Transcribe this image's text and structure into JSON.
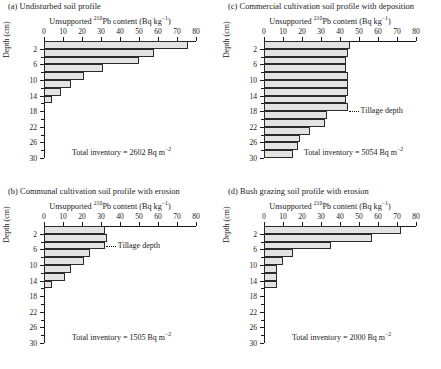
{
  "figure": {
    "axis_title_prefix": "Unsupported ",
    "axis_title_sup": "210",
    "axis_title_suffix": "Pb content (Bq kg",
    "axis_title_sup2": "−1",
    "axis_title_end": ")",
    "ylabel": "Depth (cm)",
    "inventory_prefix": "Total inventory = ",
    "inventory_unit": " Bq m",
    "inventory_unit_sup": "−2",
    "tillage_label": "Tillage depth",
    "xticks": [
      0,
      10,
      20,
      30,
      40,
      50,
      60,
      70,
      80
    ],
    "yticks_major": [
      2,
      6,
      10,
      14,
      18,
      22,
      26,
      30
    ],
    "yticks_minor": [
      0,
      4,
      8,
      12,
      16,
      20,
      24,
      28
    ],
    "bar_fill": "#e3e3e3",
    "bar_stroke": "#2b2b2b"
  },
  "chart_data": [
    {
      "id": "a",
      "type": "bar",
      "title": "(a) Undisturbed soil profile",
      "xlabel": "Unsupported 210Pb content (Bq kg-1)",
      "ylabel": "Depth (cm)",
      "xlim": [
        0,
        80
      ],
      "ylim": [
        0,
        30
      ],
      "orientation": "horizontal",
      "grid": false,
      "depth_bins": [
        [
          0,
          2
        ],
        [
          2,
          4
        ],
        [
          4,
          6
        ],
        [
          6,
          8
        ],
        [
          8,
          10
        ],
        [
          10,
          12
        ],
        [
          12,
          14
        ],
        [
          14,
          16
        ]
      ],
      "categories": [
        "0-2",
        "2-4",
        "4-6",
        "6-8",
        "8-10",
        "10-12",
        "12-14",
        "14-16"
      ],
      "values": [
        76,
        58,
        50,
        31,
        21,
        14,
        9,
        4
      ],
      "total_inventory": 2602,
      "total_inventory_text": "Total inventory = 2602 Bq m-2",
      "tillage_depth": null
    },
    {
      "id": "c",
      "type": "bar",
      "title": "(c) Commercial cultivation soil profile with deposition",
      "xlabel": "Unsupported 210Pb content (Bq kg-1)",
      "ylabel": "Depth (cm)",
      "xlim": [
        0,
        80
      ],
      "ylim": [
        0,
        30
      ],
      "orientation": "horizontal",
      "grid": false,
      "depth_bins": [
        [
          0,
          2
        ],
        [
          2,
          4
        ],
        [
          4,
          6
        ],
        [
          6,
          8
        ],
        [
          8,
          10
        ],
        [
          10,
          12
        ],
        [
          12,
          14
        ],
        [
          14,
          16
        ],
        [
          16,
          18
        ],
        [
          18,
          20
        ],
        [
          20,
          22
        ],
        [
          22,
          24
        ],
        [
          24,
          26
        ],
        [
          26,
          28
        ],
        [
          28,
          30
        ]
      ],
      "categories": [
        "0-2",
        "2-4",
        "4-6",
        "6-8",
        "8-10",
        "10-12",
        "12-14",
        "14-16",
        "16-18",
        "18-20",
        "20-22",
        "22-24",
        "24-26",
        "26-28",
        "28-30"
      ],
      "values": [
        45,
        44,
        43,
        43,
        44,
        44,
        44,
        43,
        44,
        33,
        32,
        24,
        19,
        18,
        15
      ],
      "total_inventory": 5054,
      "total_inventory_text": "Total inventory = 5054 Bq m-2",
      "tillage_depth": 18
    },
    {
      "id": "b",
      "type": "bar",
      "title": "(b) Communal cultivation soil profile with erosion",
      "xlabel": "Unsupported 210Pb content (Bq kg-1)",
      "ylabel": "Depth (cm)",
      "xlim": [
        0,
        80
      ],
      "ylim": [
        0,
        30
      ],
      "orientation": "horizontal",
      "grid": false,
      "depth_bins": [
        [
          0,
          2
        ],
        [
          2,
          4
        ],
        [
          4,
          6
        ],
        [
          6,
          8
        ],
        [
          8,
          10
        ],
        [
          10,
          12
        ],
        [
          12,
          14
        ],
        [
          14,
          16
        ]
      ],
      "categories": [
        "0-2",
        "2-4",
        "4-6",
        "6-8",
        "8-10",
        "10-12",
        "12-14",
        "14-16"
      ],
      "values": [
        32,
        33,
        32,
        24,
        21,
        14,
        11,
        4
      ],
      "total_inventory": 1505,
      "total_inventory_text": "Total inventory = 1505 Bq m-2",
      "tillage_depth": 5
    },
    {
      "id": "d",
      "type": "bar",
      "title": "(d) Bush grazing soil profile with erosion",
      "xlabel": "Unsupported 210Pb content (Bq kg-1)",
      "ylabel": "Depth (cm)",
      "xlim": [
        0,
        80
      ],
      "ylim": [
        0,
        30
      ],
      "orientation": "horizontal",
      "grid": false,
      "depth_bins": [
        [
          0,
          2
        ],
        [
          2,
          4
        ],
        [
          4,
          6
        ],
        [
          6,
          8
        ],
        [
          8,
          10
        ],
        [
          10,
          12
        ],
        [
          12,
          14
        ],
        [
          14,
          16
        ]
      ],
      "categories": [
        "0-2",
        "2-4",
        "4-6",
        "6-8",
        "8-10",
        "10-12",
        "12-14",
        "14-16"
      ],
      "values": [
        72,
        57,
        35,
        15,
        10,
        7,
        7,
        7
      ],
      "total_inventory": 2000,
      "total_inventory_text": "Total inventory = 2000 Bq m-2",
      "tillage_depth": null
    }
  ]
}
